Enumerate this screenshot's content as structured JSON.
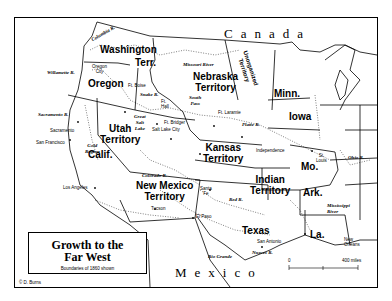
{
  "title": {
    "main_line1": "Growth to the",
    "main_line2": "Far West",
    "subtitle": "Boundaries of 1860 shown"
  },
  "copyright": "© D. Burns",
  "countries": {
    "north": "Canada",
    "south": "Mexico"
  },
  "territories": [
    {
      "name": "washington_1",
      "label": "Washington"
    },
    {
      "name": "washington_2",
      "label": "Terr."
    },
    {
      "name": "nebraska_1",
      "label": "Nebraska"
    },
    {
      "name": "nebraska_2",
      "label": "Territory"
    },
    {
      "name": "unorganized_1",
      "label": "Unorganized"
    },
    {
      "name": "unorganized_2",
      "label": "Territory"
    },
    {
      "name": "utah_1",
      "label": "Utah"
    },
    {
      "name": "utah_2",
      "label": "Territory"
    },
    {
      "name": "kansas_1",
      "label": "Kansas"
    },
    {
      "name": "kansas_2",
      "label": "Territory"
    },
    {
      "name": "newmexico_1",
      "label": "New Mexico"
    },
    {
      "name": "newmexico_2",
      "label": "Territory"
    },
    {
      "name": "indian_1",
      "label": "Indian"
    },
    {
      "name": "indian_2",
      "label": "Territory"
    }
  ],
  "states": {
    "oregon": "Oregon",
    "california": "Calif.",
    "minnesota": "Minn.",
    "iowa": "Iowa",
    "missouri": "Mo.",
    "arkansas": "Ark.",
    "texas": "Texas",
    "louisiana": "La."
  },
  "cities": {
    "oregon_city_1": "Oregon",
    "oregon_city_2": "City",
    "fort_boise": "Ft. Boise",
    "fort_hall_1": "Ft.",
    "fort_hall_2": "Hall",
    "south_pass_1": "South",
    "south_pass_2": "Pass",
    "fort_laramie": "Ft. Laramie",
    "fort_bridger": "Ft. Bridger",
    "salt_lake_city": "Salt Lake City",
    "sacramento": "Sacramento",
    "san_francisco": "San Francisco",
    "gold_region_1": "Gold",
    "gold_region_2": "Region",
    "los_angeles": "Los Angeles",
    "independence": "Independence",
    "st_louis_1": "St.",
    "st_louis_2": "Louis",
    "santa_fe_1": "Santa",
    "santa_fe_2": "Fe",
    "tucson": "Tucson",
    "el_paso": "El Paso",
    "san_antonio": "San Antonio",
    "new_orleans_1": "New",
    "new_orleans_2": "Orleans"
  },
  "water": {
    "columbia_river": "Columbia R.",
    "willamette_river": "Willamette R.",
    "snake_river": "Snake R.",
    "missouri_river": "Missouri River",
    "great_salt_lake_1": "Great",
    "great_salt_lake_2": "Salt",
    "great_salt_lake_3": "Lake",
    "sacramento_river": "Sacramento R.",
    "platte_river": "Platte R.",
    "colorado_river": "Colorado R.",
    "ohio_river": "Ohio R.",
    "red_river": "Red R.",
    "mississippi_river_1": "Mississippi",
    "mississippi_river_2": "River",
    "rio_grande": "Rio Grande",
    "nueces_river": "Nueces R."
  },
  "scale": {
    "start": "0",
    "end": "400 miles"
  }
}
